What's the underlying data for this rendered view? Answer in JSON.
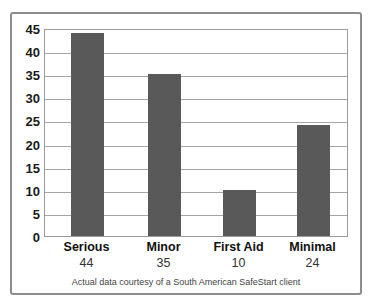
{
  "chart_data": {
    "type": "bar",
    "title": "",
    "subtitle": "",
    "xlabel": "",
    "ylabel": "",
    "categories": [
      "Serious",
      "Minor",
      "First Aid",
      "Minimal"
    ],
    "values": [
      44,
      35,
      10,
      24
    ],
    "value_labels": [
      "44",
      "35",
      "10",
      "24"
    ],
    "ylim": [
      0,
      45
    ],
    "ytick_step": 5,
    "yticks": [
      45,
      40,
      35,
      30,
      25,
      20,
      15,
      10,
      5,
      0
    ],
    "ytick_labels": [
      "45",
      "40",
      "35",
      "30",
      "25",
      "20",
      "15",
      "10",
      "5",
      "0"
    ],
    "grid": true,
    "grid_orientation": "horizontal",
    "legend": false,
    "legend_position": "none",
    "annotation": "Actual data courtesy of a South American SafeStart client",
    "bar_color": "#595959",
    "grid_color": "#a6a6a6",
    "plot_border_color": "#9a9a9a",
    "frame_color": "#8d8d8d",
    "background_color": "#ffffff",
    "text_color": "#1a1a1a"
  },
  "footnote": {
    "text": "Actual data courtesy of a South American SafeStart client"
  }
}
